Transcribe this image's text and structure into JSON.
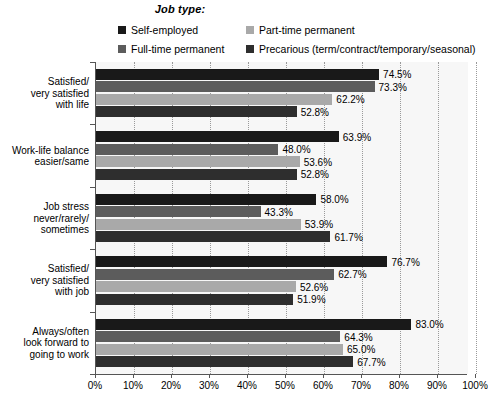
{
  "legend": {
    "title": "Job type:",
    "items": [
      {
        "label": "Self-employed",
        "color": "#191919"
      },
      {
        "label": "Part-time permanent",
        "color": "#a9a9a9"
      },
      {
        "label": "Full-time permanent",
        "color": "#5c5c5c"
      },
      {
        "label": "Precarious (term/contract/temporary/seasonal)",
        "color": "#2e2e2e"
      }
    ]
  },
  "axis": {
    "x_ticks": [
      "0%",
      "10%",
      "20%",
      "30%",
      "40%",
      "50%",
      "60%",
      "70%",
      "80%",
      "90%",
      "100%"
    ]
  },
  "chart_data": {
    "type": "bar",
    "orientation": "horizontal",
    "title": "Job type:",
    "xlabel": "",
    "ylabel": "",
    "xlim": [
      0,
      100
    ],
    "grid": true,
    "legend_position": "top",
    "categories": [
      "Satisfied/\nvery satisfied\nwith life",
      "Work-life balance\neasier/same",
      "Job stress\nnever/rarely/\nsometimes",
      "Satisfied/\nvery satisfied\nwith job",
      "Always/often\nlook forward to\ngoing to work"
    ],
    "series": [
      {
        "name": "Self-employed",
        "color": "#191919",
        "values": [
          74.5,
          63.9,
          58.0,
          76.7,
          83.0
        ],
        "labels": [
          "74.5%",
          "63.9%",
          "58.0%",
          "76.7%",
          "83.0%"
        ]
      },
      {
        "name": "Full-time permanent",
        "color": "#5c5c5c",
        "values": [
          73.3,
          48.0,
          43.3,
          62.7,
          64.3
        ],
        "labels": [
          "73.3%",
          "48.0%",
          "43.3%",
          "62.7%",
          "64.3%"
        ]
      },
      {
        "name": "Part-time permanent",
        "color": "#a9a9a9",
        "values": [
          62.2,
          53.6,
          53.9,
          52.6,
          65.0
        ],
        "labels": [
          "62.2%",
          "53.6%",
          "53.9%",
          "52.6%",
          "65.0%"
        ]
      },
      {
        "name": "Precarious (term/contract/temporary/seasonal)",
        "color": "#2e2e2e",
        "values": [
          52.8,
          52.8,
          61.7,
          51.9,
          67.7
        ],
        "labels": [
          "52.8%",
          "52.8%",
          "61.7%",
          "51.9%",
          "67.7%"
        ]
      }
    ]
  }
}
